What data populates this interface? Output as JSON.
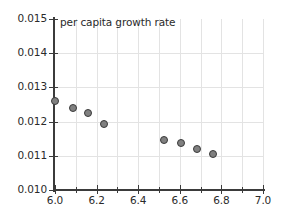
{
  "chart_data": {
    "type": "scatter",
    "title": "per capita growth rate",
    "xlabel": "",
    "ylabel": "",
    "xlim": [
      6.0,
      7.0
    ],
    "ylim": [
      0.01,
      0.015
    ],
    "grid": true,
    "legend": null,
    "marker_color": "#808080",
    "marker_edge_color": "#3a3a3a",
    "grid_color": "#e3e3e3",
    "axis_color": "#3b3b3b",
    "x_tick_labels": [
      "6.0",
      "6.2",
      "6.4",
      "6.6",
      "6.8",
      "7.0"
    ],
    "x_tick_values": [
      6.0,
      6.2,
      6.4,
      6.6,
      6.8,
      7.0
    ],
    "x_minor_tick_values": [
      6.1,
      6.3,
      6.5,
      6.7,
      6.9
    ],
    "y_tick_labels": [
      "0.015",
      "0.014",
      "0.013",
      "0.012",
      "0.011",
      "0.010"
    ],
    "y_tick_values": [
      0.015,
      0.014,
      0.013,
      0.012,
      0.011,
      0.01
    ],
    "x": [
      6.0,
      6.085,
      6.16,
      6.235,
      6.525,
      6.605,
      6.685,
      6.76
    ],
    "y": [
      0.0126,
      0.0124,
      0.01224,
      0.01192,
      0.01145,
      0.01137,
      0.0112,
      0.01105
    ],
    "points": [
      {
        "x": 6.0,
        "y": 0.0126
      },
      {
        "x": 6.085,
        "y": 0.0124
      },
      {
        "x": 6.16,
        "y": 0.01224
      },
      {
        "x": 6.235,
        "y": 0.01192
      },
      {
        "x": 6.525,
        "y": 0.01145
      },
      {
        "x": 6.605,
        "y": 0.01137
      },
      {
        "x": 6.685,
        "y": 0.0112
      },
      {
        "x": 6.76,
        "y": 0.01105
      }
    ]
  }
}
